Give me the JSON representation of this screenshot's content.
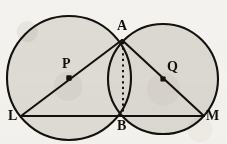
{
  "figure": {
    "background_color": "#f4f2ee",
    "fill_color": "#dedbd5",
    "stroke_color": "#14100d",
    "width": 227,
    "height": 144
  },
  "labels": {
    "A": "A",
    "B": "B",
    "L": "L",
    "M": "M",
    "P": "P",
    "Q": "Q"
  },
  "geometry": {
    "circles": [
      {
        "name": "circle-p",
        "center_label": "P",
        "cx": 69,
        "cy": 78,
        "r": 62
      },
      {
        "name": "circle-q",
        "center_label": "Q",
        "cx": 163,
        "cy": 79,
        "r": 55
      }
    ],
    "points": [
      {
        "name": "A",
        "x": 122,
        "y": 40,
        "role": "upper-intersection"
      },
      {
        "name": "B",
        "x": 123,
        "y": 115,
        "role": "lower-intersection"
      },
      {
        "name": "L",
        "x": 21,
        "y": 116,
        "role": "left-vertex"
      },
      {
        "name": "M",
        "x": 204,
        "y": 116,
        "role": "right-vertex"
      },
      {
        "name": "P",
        "x": 69,
        "y": 78,
        "role": "center-left-circle"
      },
      {
        "name": "Q",
        "x": 163,
        "y": 79,
        "role": "center-right-circle"
      }
    ],
    "segments": [
      {
        "name": "segment-LA",
        "from": "L",
        "to": "A",
        "style": "solid",
        "passes_through": "P"
      },
      {
        "name": "segment-AM",
        "from": "A",
        "to": "M",
        "style": "solid",
        "passes_through": "Q"
      },
      {
        "name": "segment-LM",
        "from": "L",
        "to": "M",
        "style": "solid"
      },
      {
        "name": "segment-AB",
        "from": "A",
        "to": "B",
        "style": "dashed"
      }
    ]
  }
}
